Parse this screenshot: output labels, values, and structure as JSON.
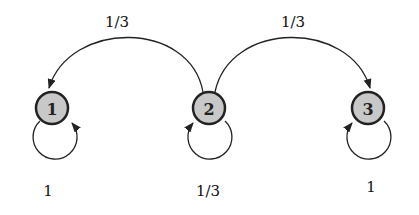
{
  "diagram": {
    "type": "markov-chain",
    "nodes": [
      {
        "id": "1",
        "label": "1",
        "x": 52,
        "y": 108
      },
      {
        "id": "2",
        "label": "2",
        "x": 209,
        "y": 108
      },
      {
        "id": "3",
        "label": "3",
        "x": 368,
        "y": 108
      }
    ],
    "edges": [
      {
        "from": "2",
        "to": "1",
        "label": "1/3"
      },
      {
        "from": "2",
        "to": "3",
        "label": "1/3"
      },
      {
        "from": "1",
        "to": "1",
        "label": "1"
      },
      {
        "from": "2",
        "to": "2",
        "label": "1/3"
      },
      {
        "from": "3",
        "to": "3",
        "label": "1"
      }
    ],
    "node_fill": "#c8c8c8",
    "stroke": "#222222"
  }
}
